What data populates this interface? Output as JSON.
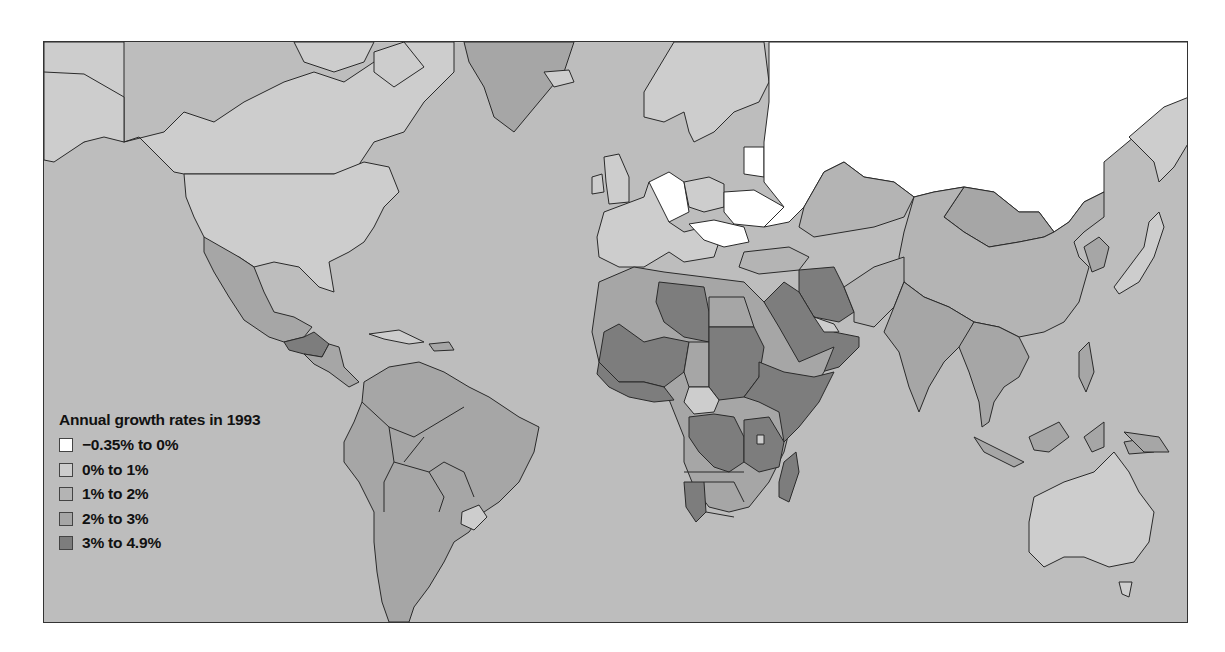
{
  "map": {
    "title": "Annual growth rates in 1993",
    "ocean_color": "#bdbdbd",
    "border_color": "#2a2a2a",
    "classes": [
      {
        "id": "c0",
        "label": "−0.35% to 0%",
        "color": "#ffffff"
      },
      {
        "id": "c1",
        "label": "0% to 1%",
        "color": "#cdcdcd"
      },
      {
        "id": "c2",
        "label": "1% to 2%",
        "color": "#b4b4b4"
      },
      {
        "id": "c3",
        "label": "2% to 3%",
        "color": "#a6a6a6"
      },
      {
        "id": "c4",
        "label": "3% to 4.9%",
        "color": "#7d7d7d"
      }
    ],
    "regions": [
      {
        "name": "Canada",
        "class": "c1"
      },
      {
        "name": "United States",
        "class": "c1"
      },
      {
        "name": "Mexico",
        "class": "c3"
      },
      {
        "name": "Guatemala",
        "class": "c4"
      },
      {
        "name": "Honduras",
        "class": "c4"
      },
      {
        "name": "Greenland",
        "class": "c3"
      },
      {
        "name": "South America (most)",
        "class": "c3"
      },
      {
        "name": "Uruguay",
        "class": "c1"
      },
      {
        "name": "Russia",
        "class": "c0"
      },
      {
        "name": "Germany",
        "class": "c0"
      },
      {
        "name": "Ukraine",
        "class": "c0"
      },
      {
        "name": "Hungary",
        "class": "c0"
      },
      {
        "name": "Romania",
        "class": "c0"
      },
      {
        "name": "Western Europe",
        "class": "c1"
      },
      {
        "name": "Scandinavia",
        "class": "c1"
      },
      {
        "name": "China",
        "class": "c2"
      },
      {
        "name": "Mongolia",
        "class": "c3"
      },
      {
        "name": "India",
        "class": "c3"
      },
      {
        "name": "Kazakhstan",
        "class": "c2"
      },
      {
        "name": "Iran",
        "class": "c4"
      },
      {
        "name": "Saudi Arabia",
        "class": "c4"
      },
      {
        "name": "Libya",
        "class": "c4"
      },
      {
        "name": "Sudan",
        "class": "c4"
      },
      {
        "name": "Niger",
        "class": "c4"
      },
      {
        "name": "Ethiopia",
        "class": "c4"
      },
      {
        "name": "Somalia",
        "class": "c4"
      },
      {
        "name": "Zaire",
        "class": "c4"
      },
      {
        "name": "Tanzania",
        "class": "c4"
      },
      {
        "name": "Madagascar",
        "class": "c4"
      },
      {
        "name": "Namibia",
        "class": "c4"
      },
      {
        "name": "Algeria",
        "class": "c3"
      },
      {
        "name": "Egypt",
        "class": "c3"
      },
      {
        "name": "Chad",
        "class": "c3"
      },
      {
        "name": "Central African Republic",
        "class": "c1"
      },
      {
        "name": "Southern Africa",
        "class": "c3"
      },
      {
        "name": "Japan",
        "class": "c1"
      },
      {
        "name": "Southeast Asia",
        "class": "c3"
      },
      {
        "name": "Australia",
        "class": "c1"
      }
    ]
  }
}
